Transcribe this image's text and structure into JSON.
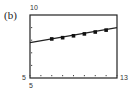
{
  "panel_label": "(b)",
  "chart_data": {
    "type": "scatter",
    "title": "",
    "xlabel": "",
    "ylabel": "",
    "xlim": [
      5,
      13
    ],
    "ylim": [
      5,
      10
    ],
    "grid": false,
    "legend": null,
    "x_ticks": [
      5,
      6,
      7,
      8,
      9,
      10,
      11,
      12,
      13
    ],
    "tick_labels": {
      "y_max": "10",
      "y_min": "5",
      "x_min": "5",
      "x_max": "13"
    },
    "series": [
      {
        "name": "data points",
        "x": [
          7,
          8,
          9,
          10,
          11,
          12
        ],
        "y": [
          8.1,
          8.2,
          8.35,
          8.5,
          8.65,
          8.8
        ]
      },
      {
        "name": "regression line",
        "type": "line",
        "x": [
          5,
          13
        ],
        "y": [
          7.8,
          9.0
        ]
      }
    ]
  }
}
